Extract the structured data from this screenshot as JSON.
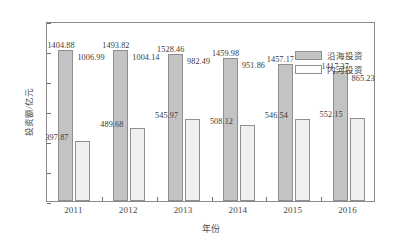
{
  "chart_data": {
    "type": "bar",
    "title": "",
    "xlabel": "年份",
    "ylabel": "投资额/亿元",
    "categories": [
      "2011",
      "2012",
      "2013",
      "2014",
      "2015",
      "2016"
    ],
    "ylim": [
      0,
      1200
    ],
    "yticks": [
      0,
      200,
      400,
      600,
      800,
      1000,
      1200
    ],
    "ytick_labels": [
      "0",
      "200",
      "400",
      "600",
      "800",
      "1000",
      "1200"
    ],
    "grid": false,
    "legend_position": "top-right inside plot area",
    "series": [
      {
        "name": "沿海投资",
        "color": "#c3c3c3",
        "values": [
          1006.99,
          1004.14,
          982.49,
          951.86,
          910.63,
          865.23
        ],
        "upper_labels": [
          "1404.88",
          "1493.82",
          "1528.46",
          "1459.98",
          "1457.17",
          "1417.37"
        ],
        "inner_labels": [
          "1006.99",
          "1004.14",
          "982.49",
          "951.86",
          "910.63",
          "865.23"
        ]
      },
      {
        "name": "内河投资",
        "color": "#efefef",
        "values": [
          397.87,
          489.68,
          545.97,
          508.12,
          546.54,
          552.15
        ],
        "inner_labels": [
          "397.87",
          "489.68",
          "545.97",
          "508.12",
          "546.54",
          "552.15"
        ]
      }
    ]
  },
  "legend": {
    "items": [
      {
        "label": "沿海投资",
        "swatch": "coastal"
      },
      {
        "label": "内河投资",
        "swatch": "inland"
      }
    ]
  },
  "caption": ""
}
